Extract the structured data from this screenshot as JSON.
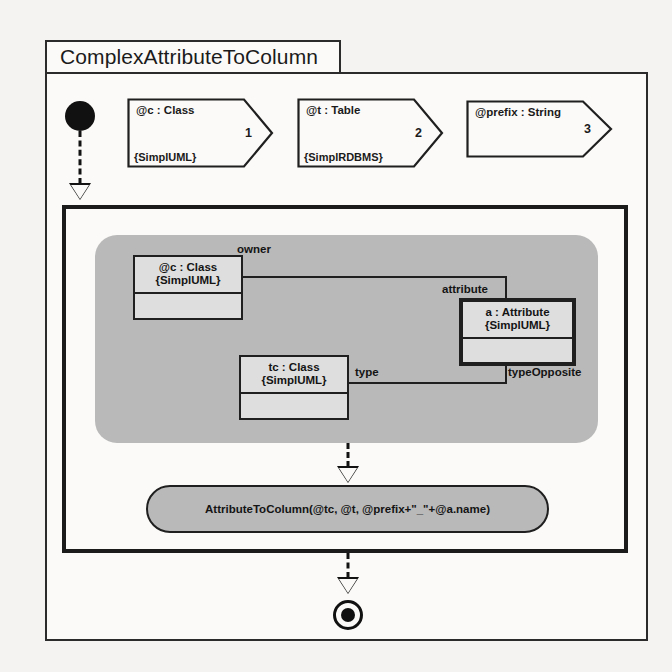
{
  "diagram": {
    "title": "ComplexAttributeToColumn",
    "parameters": [
      {
        "name": "@c : Class",
        "stereotype": "{SimplUML}",
        "index": "1"
      },
      {
        "name": "@t : Table",
        "stereotype": "{SimplRDBMS}",
        "index": "2"
      },
      {
        "name": "@prefix : String",
        "stereotype": "",
        "index": "3"
      }
    ],
    "nodes": {
      "initial": "initial-node",
      "final": "final-node"
    },
    "pattern": {
      "objects": [
        {
          "id": "c",
          "name": "@c : Class",
          "stereotype": "{SimplUML}",
          "bold": false
        },
        {
          "id": "a",
          "name": "a : Attribute",
          "stereotype": "{SimplUML}",
          "bold": true
        },
        {
          "id": "tc",
          "name": "tc : Class",
          "stereotype": "{SimplUML}",
          "bold": false
        }
      ],
      "links": [
        {
          "label": "owner"
        },
        {
          "label": "attribute"
        },
        {
          "label": "type"
        },
        {
          "label": "typeOpposite"
        }
      ]
    },
    "call": {
      "text": "AttributeToColumn(@tc, @t, @prefix+\"_\"+@a.name)"
    },
    "colors": {
      "paper": "#f4f3f1",
      "frame_stroke": "#2b2b2b",
      "pattern_fill": "#b9b9b9",
      "object_fill": "#dedede",
      "ink": "#1b1b1b"
    }
  }
}
